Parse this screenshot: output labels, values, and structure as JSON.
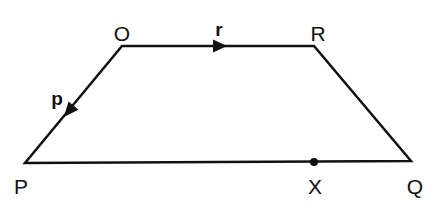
{
  "diagram": {
    "type": "trapezium-vectors",
    "colors": {
      "stroke": "#111111",
      "background": "#ffffff"
    },
    "vertices": {
      "O": {
        "label": "O",
        "x": 122,
        "y": 46,
        "label_x": 122,
        "label_y": 33
      },
      "R": {
        "label": "R",
        "x": 314,
        "y": 46,
        "label_x": 318,
        "label_y": 33
      },
      "P": {
        "label": "P",
        "x": 25,
        "y": 163,
        "label_x": 21,
        "label_y": 186
      },
      "Q": {
        "label": "Q",
        "x": 411,
        "y": 161,
        "label_x": 415,
        "label_y": 186
      },
      "X": {
        "label": "X",
        "x": 314,
        "y": 162,
        "label_x": 315,
        "label_y": 186
      }
    },
    "edges": [
      {
        "from": "O",
        "to": "R"
      },
      {
        "from": "R",
        "to": "Q"
      },
      {
        "from": "Q",
        "to": "P"
      },
      {
        "from": "P",
        "to": "O"
      }
    ],
    "vectors": {
      "r": {
        "label": "r",
        "from": "O",
        "to": "R",
        "label_x": 219,
        "label_y": 29
      },
      "p": {
        "label": "p",
        "from": "O",
        "to": "P",
        "label_x": 57,
        "label_y": 98
      }
    },
    "points": [
      {
        "name": "X",
        "on_edge": "PQ"
      }
    ]
  }
}
